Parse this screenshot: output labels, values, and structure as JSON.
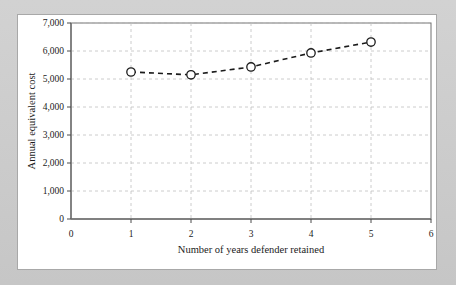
{
  "figure": {
    "background_color": "#c9c9c9",
    "card_color": "#ffffff",
    "card_border_color": "#a8a8a8"
  },
  "chart_data": {
    "type": "line",
    "title": "",
    "xlabel": "Number of years defender retained",
    "ylabel": "Annual equivalent cost",
    "x": [
      1,
      2,
      3,
      4,
      5
    ],
    "values": [
      5250,
      5150,
      5430,
      5930,
      6320
    ],
    "series": [
      {
        "name": "Annual equivalent cost",
        "x": [
          1,
          2,
          3,
          4,
          5
        ],
        "values": [
          5250,
          5150,
          5430,
          5930,
          6320
        ]
      }
    ],
    "xlim": [
      0,
      6
    ],
    "ylim": [
      0,
      7000
    ],
    "xticks": [
      0,
      1,
      2,
      3,
      4,
      5,
      6
    ],
    "yticks": [
      0,
      1000,
      2000,
      3000,
      4000,
      5000,
      6000,
      7000
    ],
    "xtick_labels": [
      "0",
      "1",
      "2",
      "3",
      "4",
      "5",
      "6"
    ],
    "ytick_labels": [
      "0",
      "1,000",
      "2,000",
      "3,000",
      "4,000",
      "5,000",
      "6,000",
      "7,000"
    ],
    "grid": true,
    "grid_style": "dashed",
    "grid_color": "#bfbfbf",
    "legend": false,
    "legend_position": "none",
    "line_style": "dashed",
    "line_color": "#1b1b1b",
    "marker": "open-circle",
    "marker_face_color": "#ffffff",
    "marker_edge_color": "#1b1b1b",
    "axis_color": "#6e6e6e",
    "frame": true
  }
}
